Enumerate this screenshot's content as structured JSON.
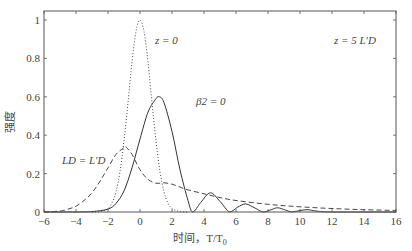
{
  "chart_data": {
    "type": "line",
    "title": "",
    "xlabel": "时间，T/T0",
    "ylabel": "强度",
    "xlim": [
      -6,
      16
    ],
    "ylim": [
      0,
      1.05
    ],
    "xticks": [
      -6,
      -4,
      -2,
      0,
      2,
      4,
      6,
      8,
      10,
      12,
      14,
      16
    ],
    "yticks": [
      0,
      0.2,
      0.4,
      0.6,
      0.8,
      1
    ],
    "grid": false,
    "legend": "none (inline annotations)",
    "annotations": [
      {
        "text": "z = 0",
        "x": 1.5,
        "y": 0.93
      },
      {
        "text": "z = 5 L'D",
        "x": 12.5,
        "y": 0.93
      },
      {
        "text": "β2 = 0",
        "x": 2.6,
        "y": 0.56
      },
      {
        "text": "LD = L'D",
        "x": -5.0,
        "y": 0.26
      }
    ],
    "series": [
      {
        "name": "z = 0 (input pulse)",
        "style": "dotted",
        "x": [
          -3,
          -2.5,
          -2,
          -1.75,
          -1.5,
          -1.25,
          -1,
          -0.75,
          -0.5,
          -0.25,
          0,
          0.25,
          0.5,
          0.75,
          1,
          1.25,
          1.5,
          1.75,
          2,
          2.5,
          3
        ],
        "y": [
          0.0,
          0.002,
          0.018,
          0.047,
          0.105,
          0.21,
          0.37,
          0.57,
          0.78,
          0.94,
          1.0,
          0.94,
          0.78,
          0.57,
          0.37,
          0.21,
          0.105,
          0.047,
          0.018,
          0.002,
          0.0
        ]
      },
      {
        "name": "β2 = 0",
        "style": "solid",
        "x": [
          -6,
          -4,
          -3,
          -2,
          -1.5,
          -1,
          -0.5,
          0,
          0.5,
          1,
          1.2,
          1.5,
          2,
          2.5,
          3,
          3.3,
          3.8,
          4.4,
          5,
          5.6,
          6.1,
          6.6,
          7.2,
          7.7,
          8.2,
          8.6,
          9.1,
          9.5,
          10,
          10.5,
          11,
          12,
          16
        ],
        "y": [
          0,
          0.0,
          0.002,
          0.015,
          0.045,
          0.11,
          0.23,
          0.38,
          0.52,
          0.59,
          0.6,
          0.57,
          0.42,
          0.22,
          0.06,
          0.0,
          0.05,
          0.1,
          0.055,
          0.0,
          0.025,
          0.042,
          0.02,
          0.0,
          0.012,
          0.022,
          0.01,
          0.0,
          0.008,
          0.012,
          0.005,
          0.0,
          0.0
        ]
      },
      {
        "name": "LD = L'D",
        "style": "dashed",
        "x": [
          -6,
          -5,
          -4.5,
          -4,
          -3.5,
          -3,
          -2.5,
          -2,
          -1.5,
          -1,
          -0.9,
          -0.5,
          0,
          0.5,
          1,
          1.5,
          2,
          2.5,
          3,
          4,
          5,
          6,
          8,
          10,
          12,
          14,
          16
        ],
        "y": [
          0,
          0.005,
          0.015,
          0.03,
          0.06,
          0.1,
          0.16,
          0.23,
          0.3,
          0.335,
          0.34,
          0.3,
          0.22,
          0.17,
          0.15,
          0.152,
          0.145,
          0.13,
          0.115,
          0.095,
          0.075,
          0.06,
          0.04,
          0.027,
          0.018,
          0.012,
          0.008
        ]
      }
    ]
  },
  "axes": {
    "xlabel_text": "时间，T/T",
    "xlabel_sub": "0",
    "ylabel_text": "强度"
  }
}
